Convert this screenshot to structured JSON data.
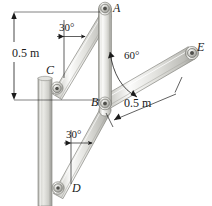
{
  "figure": {
    "type": "engineering-mechanics-frame-diagram",
    "labels": {
      "A": "A",
      "B": "B",
      "C": "C",
      "D": "D",
      "E": "E"
    },
    "dimensions": [
      {
        "id": "left-vertical",
        "text": "0.5 m"
      },
      {
        "id": "right-member-be",
        "text": "0.5 m"
      }
    ],
    "angles": [
      {
        "id": "angle-ca-from-vertical",
        "text": "30°"
      },
      {
        "id": "angle-be-from-ab",
        "text": "60°"
      },
      {
        "id": "angle-db-from-vertical",
        "text": "30°"
      }
    ],
    "joints": {
      "A": {
        "x": 105,
        "y": 8
      },
      "B": {
        "x": 105,
        "y": 103
      },
      "C": {
        "x": 57,
        "y": 88
      },
      "D": {
        "x": 58,
        "y": 188
      },
      "E": {
        "x": 192,
        "y": 53
      }
    },
    "members": [
      {
        "id": "member-CA",
        "from": "C",
        "to": "A"
      },
      {
        "id": "member-AB",
        "from": "A",
        "to": "B"
      },
      {
        "id": "member-DB",
        "from": "D",
        "to": "B"
      },
      {
        "id": "member-BE",
        "from": "B",
        "to": "E"
      }
    ],
    "wall": {
      "id": "wall-column",
      "x": 38,
      "y": 78,
      "width": 14,
      "height": 128
    },
    "colors": {
      "member_light": "#f4f4f2",
      "member_mid": "#d8d8d4",
      "member_dark": "#b0b0ab",
      "member_edge": "#8a8a85",
      "pin_ring": "#9a9a95",
      "pin_core": "#5c5c58",
      "ink": "#1b1b1b",
      "background": "#ffffff"
    }
  }
}
